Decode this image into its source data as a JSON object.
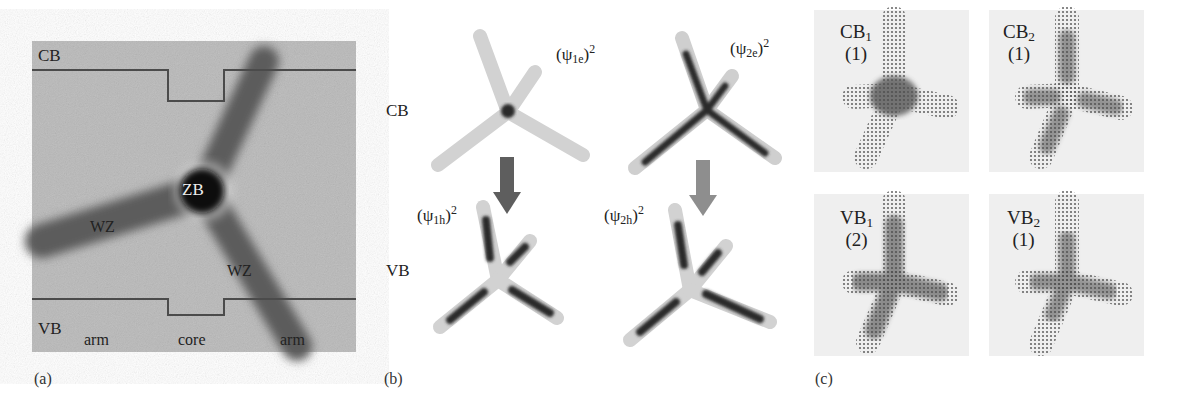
{
  "figure": {
    "panels": [
      {
        "id": "a",
        "letter": "(a)",
        "band_labels": {
          "cb": "CB",
          "vb": "VB"
        },
        "region_labels": {
          "zb": "ZB",
          "wz_left": "WZ",
          "wz_right": "WZ"
        },
        "bottom_labels": {
          "arm_left": "arm",
          "core": "core",
          "arm_right": "arm"
        },
        "colors": {
          "background": "#b9b9b9",
          "tetrapod": "#5a5a5a",
          "core": "#141414",
          "band_line": "#4a4a4a"
        }
      },
      {
        "id": "b",
        "letter": "(b)",
        "row_labels": {
          "cb": "CB",
          "vb": "VB"
        },
        "wavefunctions": [
          {
            "psi": "ψ",
            "sub": "1e",
            "sup": "2",
            "open": "(",
            "close": ")"
          },
          {
            "psi": "ψ",
            "sub": "2e",
            "sup": "2",
            "open": "(",
            "close": ")"
          },
          {
            "psi": "ψ",
            "sub": "1h",
            "sup": "2",
            "open": "(",
            "close": ")"
          },
          {
            "psi": "ψ",
            "sub": "2h",
            "sup": "2",
            "open": "(",
            "close": ")"
          }
        ],
        "arrow_colors": [
          "#5e5e5e",
          "#8e8e8e"
        ]
      },
      {
        "id": "c",
        "letter": "(c)",
        "states": [
          {
            "band": "CB",
            "index": "1",
            "degeneracy": "(1)"
          },
          {
            "band": "CB",
            "index": "2",
            "degeneracy": "(1)"
          },
          {
            "band": "VB",
            "index": "1",
            "degeneracy": "(2)"
          },
          {
            "band": "VB",
            "index": "2",
            "degeneracy": "(1)"
          }
        ]
      }
    ]
  }
}
